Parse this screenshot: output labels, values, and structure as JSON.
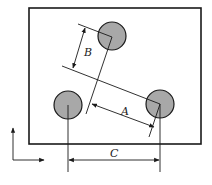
{
  "diagram": {
    "type": "engineering-dimension-drawing",
    "plate": {
      "x": 29,
      "y": 8,
      "width": 172,
      "height": 136,
      "stroke": "#1a1a1a"
    },
    "holes": [
      {
        "id": "top",
        "cx": 112,
        "cy": 36,
        "r": 14,
        "fill": "#a8a8a8"
      },
      {
        "id": "left",
        "cx": 68,
        "cy": 105,
        "r": 14,
        "fill": "#a8a8a8"
      },
      {
        "id": "right",
        "cx": 160,
        "cy": 104,
        "r": 14,
        "fill": "#a8a8a8"
      }
    ],
    "dimensions": {
      "A": {
        "label": "A",
        "description": "distance from right hole to line through top hole, measured along slanted direction"
      },
      "B": {
        "label": "B",
        "description": "perpendicular distance from top hole to line through right hole"
      },
      "C": {
        "label": "C",
        "description": "horizontal distance between left and right hole centers"
      }
    },
    "axes": {
      "vertical_arrow": "up",
      "horizontal_arrow": "right"
    },
    "colors": {
      "line": "#1a1a1a",
      "hole_fill": "#a8a8a8",
      "background": "#ffffff"
    }
  }
}
